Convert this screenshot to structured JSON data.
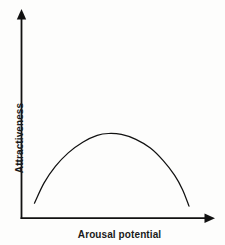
{
  "chart_data": {
    "type": "line",
    "title": "",
    "subtitle": "",
    "xlabel": "Arousal potential",
    "ylabel": "Attractiveness",
    "x_tick_labels": [],
    "y_tick_labels": [],
    "grid": false,
    "legend": null,
    "xlim": [
      0,
      1
    ],
    "ylim": [
      0,
      1
    ],
    "axis_style": "arrow-tipped L-shaped axes, no ticks",
    "annotations": [],
    "curve_shape": "inverted-U (Wundt curve)",
    "series": [
      {
        "name": "Attractiveness vs arousal potential",
        "color": "#111111",
        "x": [
          0.04,
          0.1,
          0.17,
          0.25,
          0.34,
          0.43,
          0.5,
          0.58,
          0.67,
          0.76,
          0.84,
          0.91,
          0.96,
          1.0
        ],
        "values": [
          0.07,
          0.28,
          0.45,
          0.59,
          0.7,
          0.77,
          0.79,
          0.78,
          0.73,
          0.64,
          0.51,
          0.36,
          0.21,
          0.04
        ]
      }
    ]
  },
  "figure": {
    "background_color": "#fdfdfc",
    "line_color": "#111111",
    "text_color": "#1a1a1a"
  }
}
